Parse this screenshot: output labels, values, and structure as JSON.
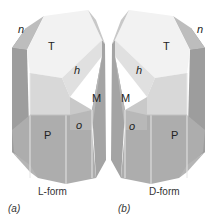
{
  "figure": {
    "panels": [
      {
        "id": "a",
        "panel_label": "(a)",
        "caption": "L-form",
        "caption_prefix": "L",
        "caption_suffix": "-form",
        "faces": {
          "T": "T",
          "n": "n",
          "h": "h",
          "M": "M",
          "P": "P",
          "o": "o"
        }
      },
      {
        "id": "b",
        "panel_label": "(b)",
        "caption": "D-form",
        "caption_prefix": "D",
        "caption_suffix": "-form",
        "faces": {
          "T": "T",
          "n": "n",
          "h": "h",
          "M": "M",
          "P": "P",
          "o": "o"
        }
      }
    ],
    "colors": {
      "top_face": "#f2f2f2",
      "h_face": "#e2e2e2",
      "n_face": "#bdbdbd",
      "side_dark": "#8f8f8f",
      "side_mid": "#a9a9a9",
      "front_upper": "#d9d9d9",
      "front_lower": "#b4b4b4",
      "bottom_face": "#a6a6a6",
      "edge": "#e8e8e8"
    }
  }
}
